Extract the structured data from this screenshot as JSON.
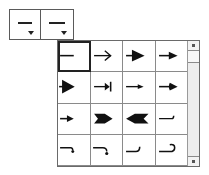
{
  "buttons": {
    "line_start": {
      "label": "line-start-style",
      "icon": "plain-line-icon"
    },
    "line_end": {
      "label": "line-end-style",
      "icon": "plain-line-icon"
    }
  },
  "popup": {
    "selected_index": 0,
    "items": [
      {
        "id": "none",
        "icon": "plain-line-icon"
      },
      {
        "id": "open-arrow",
        "icon": "open-arrow-icon"
      },
      {
        "id": "filled-arrow-large",
        "icon": "filled-arrow-large-icon"
      },
      {
        "id": "filled-arrow",
        "icon": "filled-arrow-icon"
      },
      {
        "id": "filled-arrow-wide",
        "icon": "filled-arrow-wide-icon"
      },
      {
        "id": "arrow-bar",
        "icon": "arrow-bar-icon"
      },
      {
        "id": "thin-arrow",
        "icon": "thin-arrow-icon"
      },
      {
        "id": "round-arrow",
        "icon": "round-arrow-icon"
      },
      {
        "id": "small-arrow",
        "icon": "small-arrow-icon"
      },
      {
        "id": "fletched-arrow",
        "icon": "fletched-arrow-icon"
      },
      {
        "id": "reverse-fletch",
        "icon": "reverse-fletch-icon"
      },
      {
        "id": "hook-up-small",
        "icon": "hook-up-small-icon"
      },
      {
        "id": "hook-down",
        "icon": "hook-down-icon"
      },
      {
        "id": "curve-down",
        "icon": "curve-down-icon"
      },
      {
        "id": "hook-up",
        "icon": "hook-up-icon"
      },
      {
        "id": "curl",
        "icon": "curl-icon"
      }
    ]
  },
  "scrollbar": {
    "up": "scroll-up",
    "down": "scroll-down"
  }
}
